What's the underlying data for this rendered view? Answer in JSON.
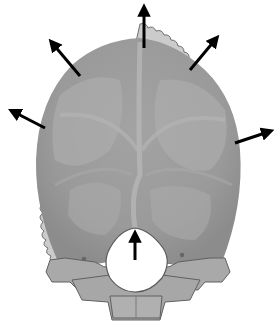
{
  "figure": {
    "colors": {
      "background": "#ffffff",
      "suture_rim": "#c9c9c9",
      "suture_outline": "#6e6e6e",
      "vault_base": "#9a9a9a",
      "vault_light": "#b4b4b4",
      "vault_dark": "#8a8a8a",
      "ridge": "#b8b8b8",
      "base_bone": "#a8a8a8",
      "base_outline": "#606060",
      "foramen": "#ffffff",
      "arrow": "#000000"
    },
    "arrows": [
      {
        "name": "arrow-top",
        "x1": 144,
        "y1": 48,
        "x2": 144,
        "y2": 6
      },
      {
        "name": "arrow-upper-left",
        "x1": 80,
        "y1": 76,
        "x2": 50,
        "y2": 40
      },
      {
        "name": "arrow-upper-right",
        "x1": 190,
        "y1": 70,
        "x2": 218,
        "y2": 36
      },
      {
        "name": "arrow-left",
        "x1": 45,
        "y1": 128,
        "x2": 10,
        "y2": 110
      },
      {
        "name": "arrow-right",
        "x1": 235,
        "y1": 143,
        "x2": 272,
        "y2": 130
      },
      {
        "name": "arrow-foramen",
        "x1": 135,
        "y1": 260,
        "x2": 135,
        "y2": 232
      }
    ]
  }
}
